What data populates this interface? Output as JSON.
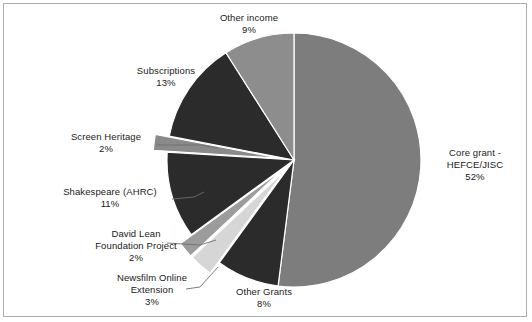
{
  "chart_data": {
    "type": "pie",
    "title": "",
    "legend_position": "none",
    "start_angle_deg": 0,
    "direction": "clockwise",
    "categories": [
      "Core grant - HEFCE/JISC",
      "Other Grants",
      "Newsfilm Online Extension",
      "David Lean Foundation Project",
      "Shakespeare (AHRC)",
      "Screen Heritage",
      "Subscriptions",
      "Other income"
    ],
    "values": [
      52,
      8,
      3,
      2,
      11,
      2,
      13,
      9
    ],
    "value_unit": "%",
    "slices": [
      {
        "name": "Core grant - HEFCE/JISC",
        "label_line1": "Core grant -",
        "label_line2": "HEFCE/JISC",
        "percent": 52,
        "percent_text": "52%",
        "color": "#7d7d7d",
        "exploded": false
      },
      {
        "name": "Other Grants",
        "label_line1": "Other Grants",
        "label_line2": "",
        "percent": 8,
        "percent_text": "8%",
        "color": "#2b2b2b",
        "exploded": false
      },
      {
        "name": "Newsfilm Online Extension",
        "label_line1": "Newsfilm Online",
        "label_line2": "Extension",
        "percent": 3,
        "percent_text": "3%",
        "color": "#d6d6d6",
        "exploded": true
      },
      {
        "name": "David Lean Foundation Project",
        "label_line1": "David Lean",
        "label_line2": "Foundation Project",
        "percent": 2,
        "percent_text": "2%",
        "color": "#9c9c9c",
        "exploded": true
      },
      {
        "name": "Shakespeare (AHRC)",
        "label_line1": "Shakespeare (AHRC)",
        "label_line2": "",
        "percent": 11,
        "percent_text": "11%",
        "color": "#2b2b2b",
        "exploded": false
      },
      {
        "name": "Screen Heritage",
        "label_line1": "Screen Heritage",
        "label_line2": "",
        "percent": 2,
        "percent_text": "2%",
        "color": "#8a8a8a",
        "exploded": true
      },
      {
        "name": "Subscriptions",
        "label_line1": "Subscriptions",
        "label_line2": "",
        "percent": 13,
        "percent_text": "13%",
        "color": "#2b2b2b",
        "exploded": false
      },
      {
        "name": "Other income",
        "label_line1": "Other income",
        "label_line2": "",
        "percent": 9,
        "percent_text": "9%",
        "color": "#8d8d8d",
        "exploded": false
      }
    ],
    "colors": {
      "background": "#ffffff",
      "border": "#aeaeae",
      "text": "#1a1a1a",
      "leader_line": "#6e6e6e",
      "slice_outline": "#ffffff"
    }
  },
  "labels": {
    "other_income": {
      "name": "Other income",
      "pct": "9%"
    },
    "subscriptions": {
      "name": "Subscriptions",
      "pct": "13%"
    },
    "screen_heritage": {
      "name": "Screen Heritage",
      "pct": "2%"
    },
    "shakespeare": {
      "name": "Shakespeare (AHRC)",
      "pct": "11%"
    },
    "david_lean": {
      "line1": "David Lean",
      "line2": "Foundation Project",
      "pct": "2%"
    },
    "newsfilm": {
      "line1": "Newsfilm Online",
      "line2": "Extension",
      "pct": "3%"
    },
    "other_grants": {
      "name": "Other Grants",
      "pct": "8%"
    },
    "core_grant": {
      "line1": "Core grant -",
      "line2": "HEFCE/JISC",
      "pct": "52%"
    }
  }
}
